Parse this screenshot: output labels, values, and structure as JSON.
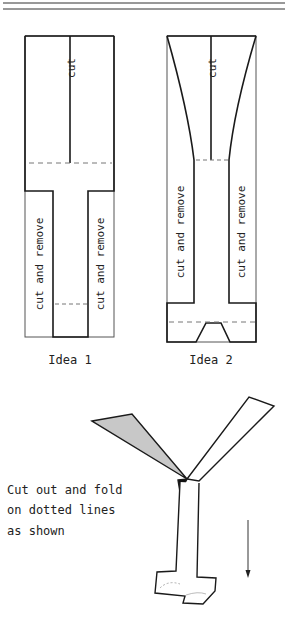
{
  "diagram": {
    "ideas": [
      {
        "caption": "Idea 1",
        "center_label": "cut",
        "left_label": "cut and remove",
        "right_label": "cut and remove"
      },
      {
        "caption": "Idea 2",
        "center_label": "cut",
        "left_label": "cut and remove",
        "right_label": "cut and remove"
      }
    ],
    "instructions": {
      "line1": "Cut out and fold",
      "line2": "on dotted lines",
      "line3": "as shown"
    },
    "colors": {
      "line": "#1a1a1a",
      "shaded_wing": "#c8c8c8",
      "dashed": "#777777"
    }
  }
}
